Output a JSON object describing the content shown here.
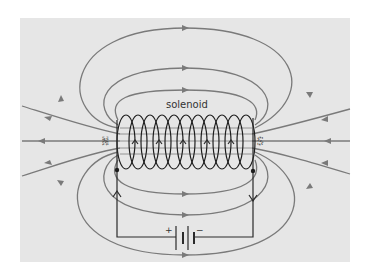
{
  "diagram": {
    "labels": {
      "solenoid": "solenoid",
      "north_pole": "N",
      "south_pole": "S",
      "battery_positive": "+",
      "battery_negative": "−"
    },
    "colors": {
      "background": "#e6e6e6",
      "field_lines": "#7a7a7a",
      "coil": "#1e1e1e",
      "wire": "#2a2a2a"
    },
    "coil_turns": 11,
    "field_lines": {
      "top_loops": 3,
      "bottom_loops": 3,
      "side_lines_each_end": 3,
      "direction": "exits N (left), returns to S (right) outside; S to N inside"
    },
    "current_direction": "up the left wire into coil, down the right wire"
  }
}
